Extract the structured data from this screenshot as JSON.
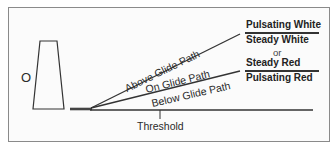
{
  "diagram": {
    "marker_circle": "O",
    "paths": {
      "above": "Above Glide Path",
      "on": "On Glide Path",
      "below": "Below Glide Path"
    },
    "signals": {
      "above_top": "Pulsating White",
      "on_upper": "Steady White",
      "or": "or",
      "on_lower": "Steady Red",
      "below_bottom": "Pulsating Red"
    },
    "threshold_label": "Threshold",
    "colors": {
      "line": "#333333",
      "border": "#8a8a8a",
      "background": "#fbfbfb"
    }
  }
}
